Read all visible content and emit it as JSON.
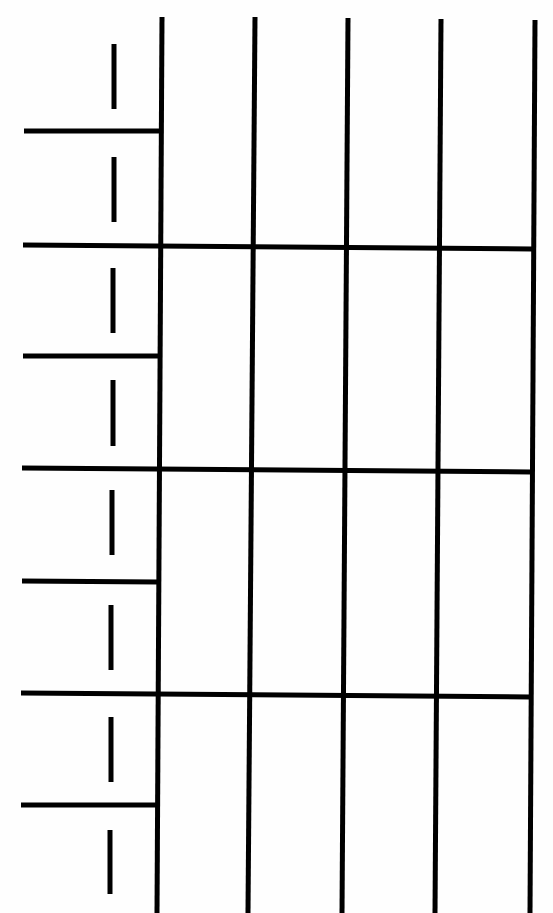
{
  "document": {
    "type": "blank-worksheet-grid",
    "background_color": "#fefefe",
    "line_color": "#000000",
    "line_width": 5,
    "dash_width": 5
  },
  "grid": {
    "vertical_lines": [
      {
        "x1": 162,
        "y1": 17,
        "x2": 157,
        "y2": 913
      },
      {
        "x1": 255,
        "y1": 17,
        "x2": 248,
        "y2": 913
      },
      {
        "x1": 348,
        "y1": 18,
        "x2": 342,
        "y2": 913
      },
      {
        "x1": 441,
        "y1": 19,
        "x2": 435,
        "y2": 913
      },
      {
        "x1": 535,
        "y1": 20,
        "x2": 530,
        "y2": 913
      }
    ],
    "full_horizontal_lines": [
      {
        "x1": 23,
        "y1": 245,
        "x2": 532,
        "y2": 249
      },
      {
        "x1": 22,
        "y1": 468,
        "x2": 531,
        "y2": 472
      },
      {
        "x1": 21,
        "y1": 693,
        "x2": 530,
        "y2": 697
      }
    ],
    "short_horizontal_lines": [
      {
        "x1": 24,
        "y1": 131,
        "x2": 161,
        "y2": 131
      },
      {
        "x1": 23,
        "y1": 356,
        "x2": 159,
        "y2": 356
      },
      {
        "x1": 22,
        "y1": 581,
        "x2": 158,
        "y2": 582
      },
      {
        "x1": 21,
        "y1": 805,
        "x2": 157,
        "y2": 805
      }
    ],
    "dashes": [
      {
        "x": 114,
        "y1": 44,
        "y2": 109
      },
      {
        "x": 114,
        "y1": 157,
        "y2": 222
      },
      {
        "x": 113,
        "y1": 268,
        "y2": 333
      },
      {
        "x": 113,
        "y1": 380,
        "y2": 446
      },
      {
        "x": 112,
        "y1": 490,
        "y2": 555
      },
      {
        "x": 111,
        "y1": 605,
        "y2": 670
      },
      {
        "x": 111,
        "y1": 717,
        "y2": 782
      },
      {
        "x": 110,
        "y1": 830,
        "y2": 894
      }
    ]
  }
}
